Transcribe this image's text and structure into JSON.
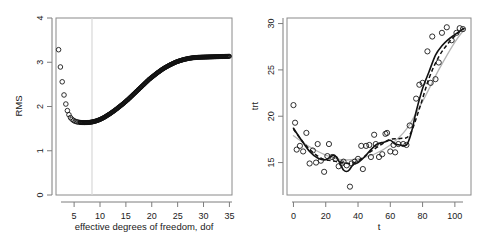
{
  "figure": {
    "panel_count": 2,
    "background": "#ffffff",
    "colors": {
      "point": "#1a1a1a",
      "curve_solid": "#111111",
      "curve_dashed": "#111111",
      "curve_gray": "#b4b4b4",
      "reference_line": "#d8d8d8",
      "frame": "#8a8a8a"
    }
  },
  "chart_data": [
    {
      "type": "scatter",
      "panel": "left",
      "title": "",
      "xlabel": "effective degrees of freedom, dof",
      "ylabel": "RMS",
      "xlim": [
        1.5,
        35.5
      ],
      "ylim": [
        -0.15,
        4.15
      ],
      "xticks": [
        5,
        10,
        15,
        20,
        25,
        30,
        35
      ],
      "yticks": [
        0,
        1,
        2,
        3,
        4
      ],
      "grid": false,
      "legend": null,
      "annotations": [
        {
          "kind": "vline",
          "x": 7.5,
          "color": "#d8d8d8",
          "label": "selected dof"
        }
      ],
      "series": [
        {
          "name": "RMS vs dof",
          "marker": "open-circle",
          "x": [
            2.0,
            2.35,
            2.7,
            3.05,
            3.4,
            3.7,
            4.0,
            4.3,
            4.6,
            4.9,
            5.2,
            5.5,
            5.8,
            6.1,
            6.5,
            7.0,
            7.5,
            8.0,
            8.5,
            9.0,
            9.5,
            10.0,
            10.5,
            11.0,
            11.5,
            12.0,
            12.5,
            13.0,
            13.5,
            14.0,
            14.5,
            15.0,
            15.5,
            16.0,
            16.5,
            17.0,
            17.5,
            18.0,
            18.5,
            19.0,
            19.5,
            20.0,
            20.5,
            21.0,
            21.5,
            22.0,
            22.5,
            23.0,
            23.5,
            24.0,
            24.5,
            25.0,
            25.5,
            26.0,
            26.5,
            27.0,
            27.5,
            28.0,
            28.5,
            29.0,
            29.5,
            30.0,
            30.5,
            31.0,
            31.5,
            32.0,
            32.5,
            33.0,
            33.5,
            34.0,
            34.5,
            35.0
          ],
          "y": [
            3.38,
            2.96,
            2.6,
            2.28,
            2.06,
            1.9,
            1.8,
            1.73,
            1.69,
            1.66,
            1.64,
            1.63,
            1.62,
            1.615,
            1.61,
            1.608,
            1.61,
            1.615,
            1.625,
            1.64,
            1.66,
            1.685,
            1.715,
            1.75,
            1.79,
            1.83,
            1.875,
            1.92,
            1.97,
            2.02,
            2.07,
            2.125,
            2.18,
            2.24,
            2.3,
            2.36,
            2.42,
            2.48,
            2.54,
            2.6,
            2.66,
            2.71,
            2.76,
            2.81,
            2.855,
            2.9,
            2.94,
            2.975,
            3.01,
            3.04,
            3.07,
            3.095,
            3.115,
            3.135,
            3.15,
            3.165,
            3.175,
            3.185,
            3.19,
            3.195,
            3.198,
            3.2,
            3.202,
            3.204,
            3.206,
            3.208,
            3.21,
            3.212,
            3.214,
            3.216,
            3.218,
            3.22
          ]
        }
      ]
    },
    {
      "type": "scatter",
      "panel": "right",
      "title": "",
      "xlabel": "t",
      "ylabel": "trt",
      "xlim": [
        -4,
        110
      ],
      "ylim": [
        11.5,
        30.6
      ],
      "xticks": [
        0,
        20,
        40,
        60,
        80,
        100
      ],
      "yticks": [
        15,
        20,
        25,
        30
      ],
      "grid": false,
      "legend": null,
      "series": [
        {
          "name": "observations",
          "marker": "open-circle",
          "x": [
            0,
            1,
            2,
            4,
            6,
            8,
            10,
            12,
            14,
            15,
            17,
            19,
            21,
            22,
            24,
            26,
            28,
            30,
            31,
            33,
            35,
            36,
            38,
            40,
            42,
            43,
            45,
            47,
            48,
            50,
            51,
            53,
            55,
            57,
            58,
            60,
            62,
            63,
            65,
            68,
            70,
            72,
            76,
            78,
            80,
            83,
            85,
            86,
            88,
            90,
            92,
            95,
            98,
            101,
            103,
            105
          ],
          "y": [
            21.2,
            19.3,
            16.4,
            16.8,
            16.2,
            18.2,
            14.9,
            16.3,
            15.0,
            17.0,
            15.2,
            14.0,
            15.7,
            17.0,
            15.6,
            15.4,
            14.6,
            14.9,
            15.1,
            14.7,
            12.4,
            14.9,
            15.1,
            15.4,
            16.8,
            14.3,
            16.8,
            16.9,
            15.6,
            18.0,
            17.0,
            15.6,
            15.9,
            18.1,
            18.2,
            16.2,
            16.9,
            16.1,
            17.0,
            17.0,
            16.9,
            19.0,
            21.9,
            23.4,
            23.6,
            27.0,
            23.6,
            28.6,
            24.0,
            25.8,
            29.0,
            29.6,
            28.2,
            29.0,
            29.5,
            29.4
          ]
        },
        {
          "name": "wiggly smoother",
          "style": "solid",
          "x": [
            0,
            5,
            10,
            15,
            20,
            25,
            28,
            31,
            34,
            37,
            40,
            44,
            48,
            52,
            56,
            60,
            63,
            66,
            70,
            73,
            76,
            80,
            84,
            88,
            92,
            96,
            100,
            105
          ],
          "y": [
            18.7,
            17.4,
            16.2,
            15.5,
            15.3,
            15.8,
            15.2,
            14.2,
            14.1,
            14.8,
            15.0,
            15.6,
            16.4,
            17.0,
            17.2,
            17.4,
            17.0,
            16.9,
            16.9,
            18.2,
            20.5,
            23.0,
            24.8,
            26.6,
            27.6,
            28.3,
            28.8,
            29.4
          ]
        },
        {
          "name": "dashed smoother",
          "style": "dashed",
          "x": [
            0,
            6,
            12,
            18,
            24,
            30,
            36,
            42,
            48,
            54,
            60,
            66,
            72,
            78,
            84,
            90,
            96,
            102,
            106
          ],
          "y": [
            18.6,
            17.2,
            16.1,
            15.4,
            15.2,
            15.0,
            14.9,
            15.4,
            16.2,
            16.9,
            17.5,
            17.6,
            18.0,
            20.8,
            24.1,
            26.4,
            27.9,
            29.0,
            29.5
          ]
        },
        {
          "name": "gray smooth fit",
          "style": "gray",
          "x": [
            0,
            10,
            20,
            30,
            40,
            50,
            60,
            70,
            80,
            90,
            100,
            106
          ],
          "y": [
            17.9,
            16.7,
            15.8,
            15.3,
            15.4,
            15.9,
            16.9,
            18.6,
            21.6,
            25.0,
            28.0,
            29.4
          ]
        }
      ]
    }
  ]
}
